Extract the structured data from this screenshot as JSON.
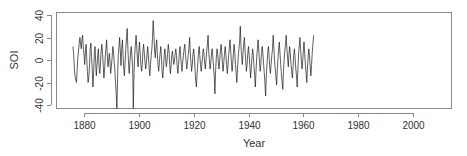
{
  "chart_data": {
    "type": "line",
    "title": "",
    "xlabel": "Year",
    "ylabel": "SOI",
    "xlim": [
      1872,
      2013
    ],
    "ylim": [
      -43,
      43
    ],
    "x_ticks": [
      1880,
      1900,
      1920,
      1940,
      1960,
      1980,
      2000
    ],
    "y_ticks": [
      -40,
      -20,
      0,
      20,
      40
    ],
    "grid": false,
    "legend": null,
    "line_color": "#1a1a1a",
    "series": [
      {
        "name": "SOI",
        "start_year": 1876,
        "step_years": 0.25,
        "values": [
          12,
          5,
          -8,
          -15,
          -18,
          -20,
          -10,
          2,
          8,
          15,
          20,
          14,
          10,
          18,
          22,
          12,
          5,
          -4,
          8,
          14,
          2,
          -10,
          -20,
          -15,
          -5,
          10,
          15,
          3,
          -8,
          -24,
          -12,
          5,
          12,
          -2,
          -14,
          -5,
          4,
          10,
          -6,
          -12,
          -2,
          8,
          14,
          6,
          -4,
          -16,
          -8,
          2,
          10,
          18,
          5,
          -6,
          0,
          6,
          -2,
          -12,
          -5,
          2,
          12,
          8,
          -3,
          -8,
          -20,
          -30,
          -43,
          -15,
          5,
          12,
          20,
          8,
          -5,
          10,
          18,
          4,
          -8,
          -14,
          -2,
          10,
          20,
          28,
          10,
          -4,
          -12,
          -3,
          8,
          12,
          2,
          -6,
          -43,
          -12,
          5,
          14,
          22,
          10,
          0,
          -6,
          8,
          16,
          6,
          -4,
          -10,
          -4,
          8,
          14,
          6,
          -2,
          -8,
          -2,
          6,
          12,
          4,
          -6,
          -14,
          -4,
          4,
          10,
          20,
          35,
          22,
          8,
          2,
          12,
          18,
          6,
          -4,
          -10,
          -2,
          6,
          12,
          2,
          -10,
          -16,
          -6,
          4,
          10,
          2,
          -6,
          -2,
          6,
          14,
          8,
          -4,
          -12,
          -6,
          4,
          8,
          2,
          -4,
          0,
          6,
          10,
          4,
          -6,
          -12,
          -4,
          6,
          12,
          4,
          -4,
          -10,
          -2,
          4,
          10,
          14,
          6,
          -2,
          -8,
          -2,
          4,
          10,
          20,
          8,
          -2,
          -10,
          -4,
          6,
          10,
          2,
          -8,
          -18,
          -24,
          -12,
          -2,
          6,
          12,
          4,
          -4,
          -10,
          -4,
          4,
          10,
          6,
          -2,
          -8,
          0,
          8,
          14,
          22,
          8,
          0,
          -8,
          -2,
          6,
          10,
          2,
          -6,
          -14,
          -30,
          -10,
          2,
          10,
          6,
          -2,
          -8,
          0,
          8,
          14,
          6,
          -4,
          -10,
          -2,
          6,
          12,
          4,
          -4,
          -12,
          -6,
          4,
          10,
          18,
          8,
          -2,
          -10,
          -4,
          6,
          14,
          6,
          -4,
          -12,
          -20,
          -8,
          2,
          10,
          16,
          30,
          12,
          4,
          -4,
          6,
          14,
          20,
          8,
          -2,
          -10,
          -4,
          6,
          12,
          4,
          -6,
          -16,
          -8,
          2,
          10,
          4,
          -6,
          -14,
          -24,
          -10,
          2,
          10,
          18,
          8,
          -2,
          -10,
          -4,
          6,
          12,
          6,
          -4,
          -12,
          -20,
          -32,
          -14,
          -4,
          6,
          12,
          4,
          -6,
          -12,
          -4,
          4,
          10,
          22,
          10,
          0,
          -8,
          -14,
          -22,
          -8,
          2,
          10,
          16,
          6,
          -4,
          -12,
          -20,
          -26,
          -10,
          0,
          8,
          14,
          22,
          10,
          2,
          -6,
          4,
          12,
          6,
          -4,
          -10,
          -16,
          -6,
          4,
          10,
          2,
          -8,
          -14,
          -24,
          -8,
          4,
          12,
          20,
          10,
          0,
          -8,
          -2,
          8,
          16,
          6,
          -4,
          -12,
          -20,
          -8,
          2,
          10,
          4,
          -6,
          -14,
          -4,
          6,
          14,
          22
        ]
      }
    ]
  }
}
